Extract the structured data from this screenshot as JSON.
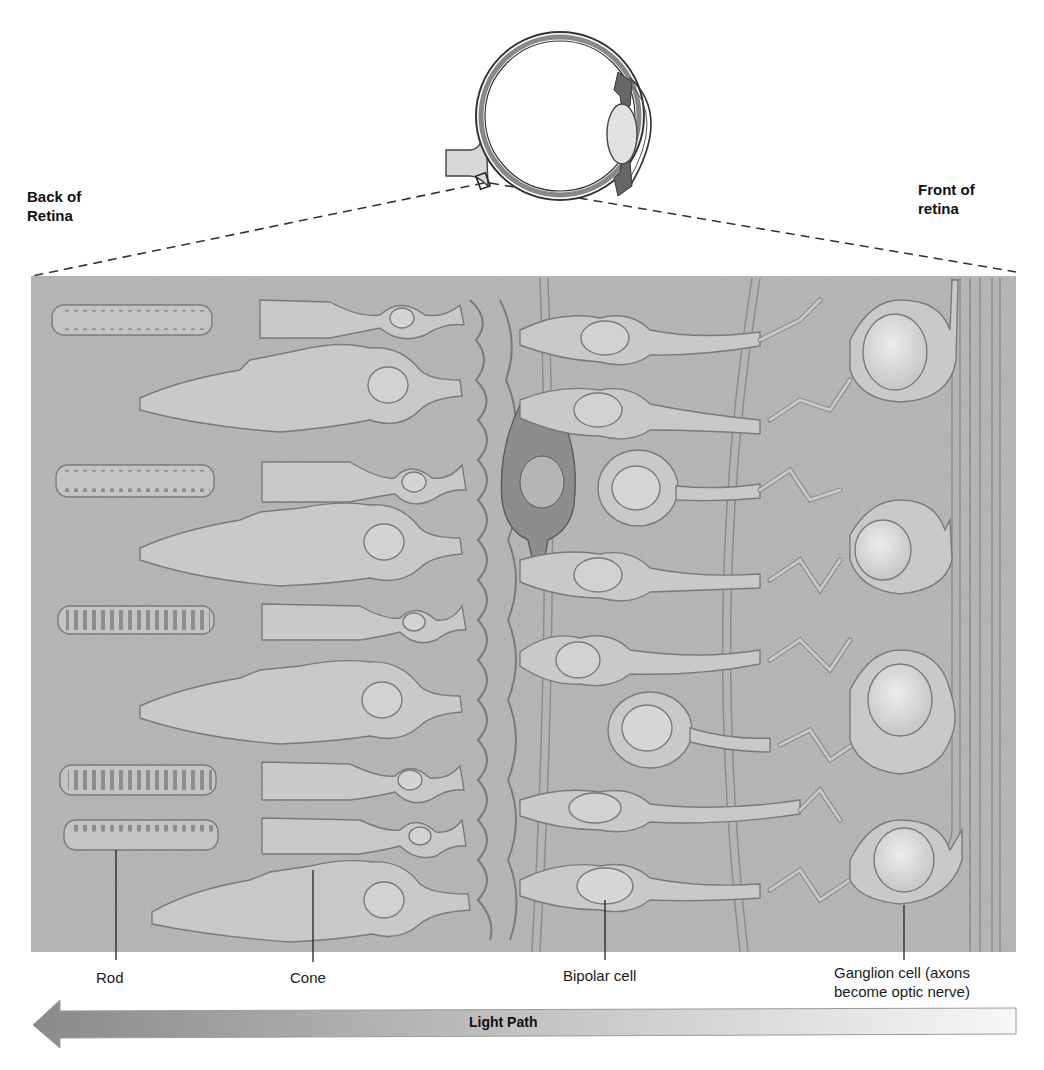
{
  "labels": {
    "back_of_retina": [
      "Back of",
      "Retina"
    ],
    "front_of_retina": [
      "Front of",
      "retina"
    ]
  },
  "cell_labels": [
    {
      "name": "rod",
      "text": "Rod",
      "x": 116,
      "pointer_top": 850
    },
    {
      "name": "cone",
      "text": "Cone",
      "x": 313,
      "pointer_top": 870
    },
    {
      "name": "bipolar-cell",
      "text": "Bipolar cell",
      "x": 605,
      "pointer_top": 900
    },
    {
      "name": "ganglion-cell",
      "text_lines": [
        "Ganglion cell (axons",
        "become optic nerve)"
      ],
      "x": 904,
      "pointer_top": 905
    }
  ],
  "light_path": {
    "label": "Light Path",
    "direction": "right-to-left"
  },
  "colors": {
    "panel_bg": "#b9b9b9",
    "cell_fill": "#c9c9c9",
    "cell_outline": "#7a7a7a",
    "dark_cell": "#8a8a8a",
    "ganglion_nucleus": "#e4e4e4",
    "arrow_dark": "#8c8c8c",
    "arrow_light": "#f4f4f4"
  }
}
